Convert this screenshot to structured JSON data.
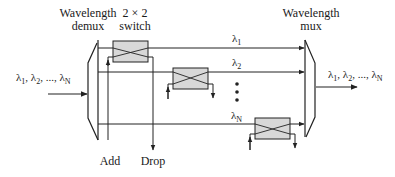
{
  "labels": {
    "demux_line1": "Wavelength",
    "demux_line2": "demux",
    "switch_line1": "2 × 2",
    "switch_line2": "switch",
    "mux_line1": "Wavelength",
    "mux_line2": "mux",
    "input": "λ1, λ2, ..., λN",
    "output": "λ1, λ2, ..., λN",
    "add": "Add",
    "drop": "Drop"
  },
  "channels": [
    {
      "name": "λ",
      "sub": "1"
    },
    {
      "name": "λ",
      "sub": "2"
    },
    {
      "name": "λ",
      "sub": "N"
    }
  ],
  "input_label": {
    "parts": [
      {
        "t": "λ",
        "s": "1"
      },
      {
        "t": "λ",
        "s": "2"
      },
      {
        "t": "λ",
        "s": "N"
      }
    ]
  },
  "ellipsis_dots": 3,
  "colors": {
    "stroke": "#222222",
    "switch_fill": "#d8d8d8",
    "background": "#ffffff"
  }
}
